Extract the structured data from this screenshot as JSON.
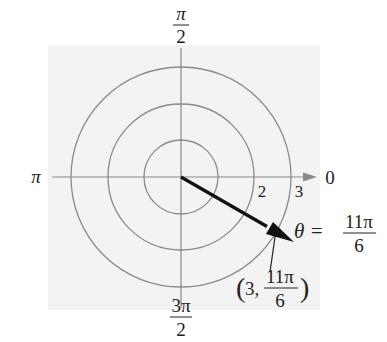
{
  "diagram": {
    "type": "polar-coordinate-plot",
    "center_px": [
      181,
      177
    ],
    "circle_radii_px": [
      37,
      73,
      110
    ],
    "circle_values": [
      1,
      2,
      3
    ],
    "axis_labels": {
      "right": "0",
      "top_num": "π",
      "top_den": "2",
      "left": "π",
      "bottom_num": "3π",
      "bottom_den": "2"
    },
    "radius_tick_labels": [
      "2",
      "3"
    ],
    "point": {
      "r": 3,
      "theta_label_prefix": "θ =",
      "theta_num": "11π",
      "theta_den": "6",
      "coord_open": "(3,",
      "coord_num": "11π",
      "coord_den": "6",
      "coord_close": ")"
    },
    "colors": {
      "background_panel": "#f3f3f3",
      "grid": "#8a8a8a",
      "ray": "#111111"
    }
  }
}
